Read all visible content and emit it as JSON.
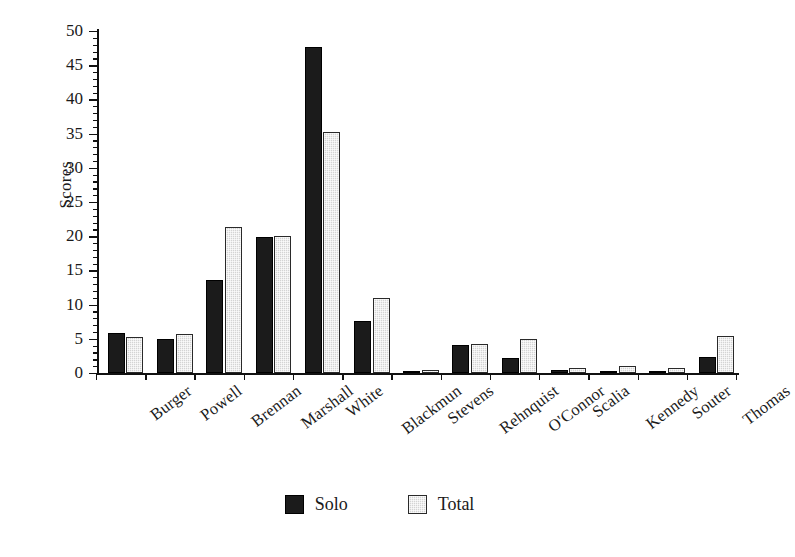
{
  "chart_data": {
    "type": "bar",
    "title": "",
    "subtitle": "",
    "xlabel": "",
    "ylabel": "Scores",
    "ylim": [
      0,
      50
    ],
    "ytick_step": 5,
    "yminor_step": 1,
    "grid": false,
    "legend_position": "bottom-center",
    "categories": [
      "Burger",
      "Powell",
      "Brennan",
      "Marshall",
      "White",
      "Blackmun",
      "Stevens",
      "Rehnquist",
      "O'Connor",
      "Scalia",
      "Kennedy",
      "Souter",
      "Thomas"
    ],
    "ytick_labels": [
      "0",
      "5",
      "10",
      "15",
      "20",
      "25",
      "30",
      "35",
      "40",
      "45",
      "50"
    ],
    "series": [
      {
        "name": "Solo",
        "color": "#1b1b1b",
        "values": [
          5.8,
          5.0,
          13.6,
          19.9,
          47.7,
          7.6,
          0.1,
          4.1,
          2.2,
          0.5,
          0.3,
          0.2,
          2.3
        ]
      },
      {
        "name": "Total",
        "color": "#d4d4d4",
        "values": [
          5.3,
          5.7,
          21.4,
          20.0,
          35.3,
          11.0,
          0.5,
          4.2,
          5.0,
          0.8,
          1.0,
          0.7,
          5.4
        ]
      }
    ]
  },
  "legend": {
    "items": [
      {
        "label": "Solo",
        "swatch": "solo"
      },
      {
        "label": "Total",
        "swatch": "total"
      }
    ]
  }
}
